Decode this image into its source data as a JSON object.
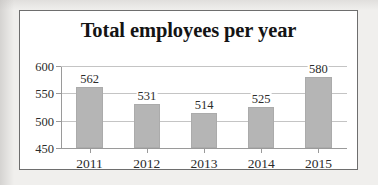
{
  "chart_data": {
    "type": "bar",
    "title": "Total employees per year",
    "xlabel": "",
    "ylabel": "",
    "categories": [
      "2011",
      "2012",
      "2013",
      "2014",
      "2015"
    ],
    "values": [
      562,
      531,
      514,
      525,
      580
    ],
    "value_labels": [
      "562",
      "531",
      "514",
      "525",
      "580"
    ],
    "ytick_labels": [
      "450",
      "500",
      "550",
      "600"
    ],
    "yticks": [
      450,
      500,
      550,
      600
    ],
    "ylim": [
      450,
      600
    ],
    "grid": true,
    "legend": false,
    "legend_position": "none",
    "series": [
      {
        "name": "Total employees",
        "values": [
          562,
          531,
          514,
          525,
          580
        ]
      }
    ]
  },
  "style": {
    "bar_color": "#b5b5b5",
    "bar_border_color": "#ababab",
    "grid_color": "#c4c4c4",
    "axis_color": "#9a9a9a",
    "frame_border_color": "#6e6e6e",
    "plot_background": "#ffffff",
    "page_background": "#f0efed",
    "text_color": "#2b2b2b",
    "title_color": "#141414"
  }
}
